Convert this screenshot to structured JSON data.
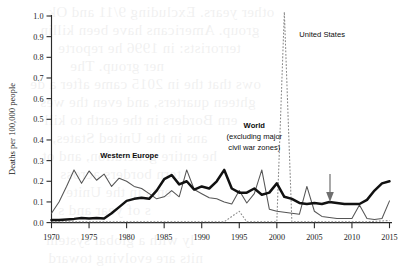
{
  "chart_data": {
    "type": "line",
    "title": "",
    "xlabel": "",
    "ylabel": "Deaths per 100,000 people",
    "xlim": [
      1970,
      2015
    ],
    "ylim": [
      0.0,
      1.0
    ],
    "grid": false,
    "legend": "inline-annotations",
    "xticks": [
      1970,
      1975,
      1980,
      1985,
      1990,
      1995,
      2000,
      2005,
      2010,
      2015
    ],
    "xticklabels": [
      "1970",
      "1975",
      "1980",
      "1985",
      "1990",
      "1995",
      "2000",
      "2005",
      "2010",
      "2015"
    ],
    "yticks": [
      0.0,
      0.1,
      0.2,
      0.3,
      0.4,
      0.5,
      0.6,
      0.7,
      0.8,
      0.9,
      1.0
    ],
    "yticklabels": [
      "0.0",
      "0.1",
      "0.2",
      "0.3",
      "0.4",
      "0.5",
      "0.6",
      "0.7",
      "0.8",
      "0.9",
      "1.0"
    ],
    "annotations": [
      {
        "name": "western-europe-label",
        "text": "Western Europe",
        "x": 1976.5,
        "y": 0.315
      },
      {
        "name": "world-label-line1",
        "text": "World",
        "x": 1997.0,
        "y": 0.46
      },
      {
        "name": "world-label-line2",
        "text": "(excluding major",
        "x": 1997.0,
        "y": 0.405
      },
      {
        "name": "world-label-line3",
        "text": "civil war zones)",
        "x": 1997.0,
        "y": 0.352
      },
      {
        "name": "united-states-label",
        "text": "United States",
        "x": 2003.0,
        "y": 0.9
      },
      {
        "name": "decline-arrow",
        "text": "",
        "x": 2008.8,
        "y": 0.22
      }
    ],
    "series": [
      {
        "name": "Western Europe",
        "style": "thin-solid",
        "x": [
          1970,
          1971,
          1972,
          1973,
          1974,
          1975,
          1976,
          1977,
          1978,
          1979,
          1980,
          1981,
          1982,
          1983,
          1984,
          1985,
          1986,
          1987,
          1988,
          1989,
          1990,
          1991,
          1992,
          1993,
          1994,
          1995,
          1996,
          1997,
          1998,
          1999,
          2000,
          2001,
          2002,
          2003,
          2004,
          2005,
          2006,
          2007,
          2008,
          2009,
          2010,
          2011,
          2012,
          2013,
          2014,
          2015
        ],
        "values": [
          0.045,
          0.1,
          0.175,
          0.255,
          0.19,
          0.25,
          0.205,
          0.235,
          0.175,
          0.215,
          0.2,
          0.175,
          0.165,
          0.14,
          0.115,
          0.125,
          0.155,
          0.125,
          0.255,
          0.16,
          0.14,
          0.12,
          0.115,
          0.1,
          0.09,
          0.155,
          0.095,
          0.14,
          0.255,
          0.065,
          0.055,
          0.05,
          0.045,
          0.04,
          0.175,
          0.055,
          0.03,
          0.025,
          0.02,
          0.02,
          0.02,
          0.085,
          0.02,
          0.015,
          0.02,
          0.105
        ]
      },
      {
        "name": "World (excluding major civil war zones)",
        "style": "thick-solid",
        "x": [
          1970,
          1971,
          1972,
          1973,
          1974,
          1975,
          1976,
          1977,
          1978,
          1979,
          1980,
          1981,
          1982,
          1983,
          1984,
          1985,
          1986,
          1987,
          1988,
          1989,
          1990,
          1991,
          1992,
          1993,
          1994,
          1995,
          1996,
          1997,
          1998,
          1999,
          2000,
          2001,
          2002,
          2003,
          2004,
          2005,
          2006,
          2007,
          2008,
          2009,
          2010,
          2011,
          2012,
          2013,
          2014,
          2015
        ],
        "values": [
          0.012,
          0.012,
          0.015,
          0.018,
          0.022,
          0.02,
          0.022,
          0.02,
          0.045,
          0.075,
          0.105,
          0.115,
          0.12,
          0.115,
          0.155,
          0.21,
          0.23,
          0.185,
          0.2,
          0.16,
          0.175,
          0.165,
          0.2,
          0.255,
          0.165,
          0.145,
          0.145,
          0.165,
          0.135,
          0.145,
          0.19,
          0.125,
          0.115,
          0.095,
          0.09,
          0.095,
          0.09,
          0.1,
          0.095,
          0.09,
          0.09,
          0.09,
          0.11,
          0.155,
          0.19,
          0.2
        ]
      },
      {
        "name": "United States",
        "style": "dashed",
        "x": [
          1970,
          1975,
          1980,
          1985,
          1990,
          1993,
          1995,
          1996,
          1997,
          1998,
          1999,
          2000,
          2001,
          2002,
          2003,
          2005,
          2008,
          2010,
          2012,
          2015
        ],
        "values": [
          0.004,
          0.004,
          0.004,
          0.004,
          0.004,
          0.004,
          0.055,
          0.004,
          0.004,
          0.004,
          0.004,
          0.004,
          1.02,
          0.004,
          0.004,
          0.004,
          0.004,
          0.004,
          0.004,
          0.01
        ]
      }
    ]
  },
  "background_bleed": [
    {
      "text": "other years. Excluding 9/11 and Ok",
      "x": 48,
      "y": 4
    },
    {
      "text": "group. Americans have been killin",
      "x": 40,
      "y": 22
    },
    {
      "text": "terrorists: in 1996 he reporte",
      "x": 58,
      "y": 40
    },
    {
      "text": "ner group. The",
      "x": 70,
      "y": 58
    },
    {
      "text": "ows that the in 2015 came after a de",
      "x": 30,
      "y": 76
    },
    {
      "text": "ghteen quarters, and even the wes",
      "x": 40,
      "y": 94
    },
    {
      "text": "ern Borders in the earth to kill",
      "x": 44,
      "y": 112
    },
    {
      "text": "ans in the United States,",
      "x": 52,
      "y": 130
    },
    {
      "text": "he entire generation, and ot",
      "x": 42,
      "y": 148
    },
    {
      "text": "tern borders across",
      "x": 60,
      "y": 166
    },
    {
      "text": "ents in the Unite",
      "x": 66,
      "y": 184
    },
    {
      "text": "s of year and s",
      "x": 58,
      "y": 202
    },
    {
      "text": "ly with a global system",
      "x": 46,
      "y": 232
    },
    {
      "text": "nits are evolving toward",
      "x": 48,
      "y": 250
    }
  ]
}
